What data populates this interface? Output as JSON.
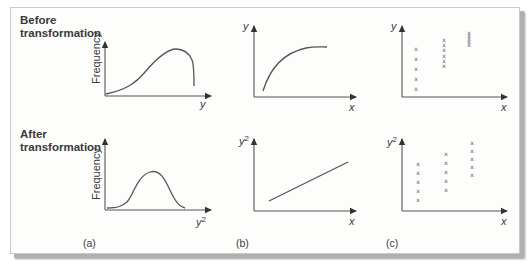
{
  "rows": {
    "before": {
      "line1": "Before",
      "line2": "transformation"
    },
    "after": {
      "line1": "After",
      "line2": "transformation"
    }
  },
  "panels": {
    "a": {
      "tag": "(a)",
      "before": {
        "ylabel": "Frequency",
        "xlabel": "y",
        "shape": "right-skewed distribution curve"
      },
      "after": {
        "ylabel": "Frequency",
        "xlabel_base": "y",
        "xlabel_exp": "2",
        "shape": "symmetric bell curve"
      }
    },
    "b": {
      "tag": "(b)",
      "before": {
        "ylabel": "y",
        "xlabel": "x",
        "shape": "concave increasing curve"
      },
      "after": {
        "ylabel_base": "y",
        "ylabel_exp": "2",
        "xlabel": "x",
        "shape": "straight increasing line"
      }
    },
    "c": {
      "tag": "(c)",
      "before": {
        "ylabel": "y",
        "xlabel": "x",
        "marker": "x",
        "group_counts": [
          5,
          6,
          5
        ]
      },
      "after": {
        "ylabel_base": "y",
        "ylabel_exp": "2",
        "xlabel": "x",
        "marker": "x",
        "group_counts": [
          5,
          5,
          5
        ]
      }
    }
  }
}
